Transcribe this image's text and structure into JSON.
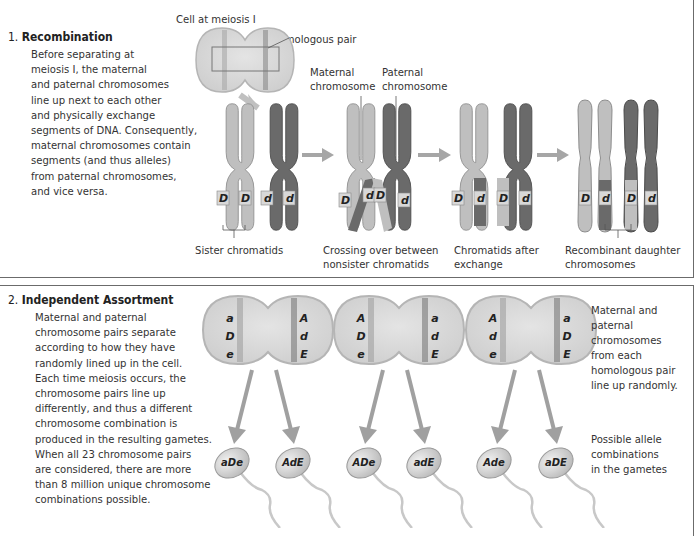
{
  "colors": {
    "maternal": "#bfbfbf",
    "paternal": "#6e6e6e",
    "arrow": "#a0a0a0",
    "cell_fill": "#d9d9d9",
    "border": "#6b6b6b"
  },
  "section1": {
    "number": "1.",
    "title": "Recombination",
    "body": [
      "Before separating at",
      "meiosis I, the maternal",
      "and paternal chromosomes",
      "line up next to each other",
      "and physically exchange",
      "segments of DNA. Consequently,",
      "maternal chromosomes contain",
      "segments (and thus alleles)",
      "from paternal chromosomes,",
      "and vice versa."
    ],
    "labels": {
      "cell": "Cell at meiosis I",
      "homologous_pair": "Homologous pair",
      "maternal_1": "Maternal",
      "maternal_2": "chromosome",
      "paternal_1": "Paternal",
      "paternal_2": "chromosome",
      "sister": "Sister chromatids",
      "crossing_1": "Crossing over between",
      "crossing_2": "nonsister chromatids",
      "after_1": "Chromatids after",
      "after_2": "exchange",
      "recomb_1": "Recombinant daughter",
      "recomb_2": "chromosomes"
    },
    "stages": [
      {
        "name": "before",
        "alleles": [
          "D",
          "D",
          "d",
          "d"
        ]
      },
      {
        "name": "crossing-over",
        "alleles": [
          "D",
          "d",
          "D",
          "d"
        ]
      },
      {
        "name": "after-exchange",
        "alleles": [
          "D",
          "d",
          "D",
          "d"
        ]
      },
      {
        "name": "recombinant",
        "alleles": [
          "D",
          "d",
          "D",
          "d"
        ]
      }
    ]
  },
  "section2": {
    "number": "2.",
    "title": "Independent Assortment",
    "body": [
      "Maternal and paternal",
      "chromosome pairs separate",
      "according to how they have",
      "randomly lined up in the cell.",
      "Each time meiosis occurs, the",
      "chromosome pairs line up",
      "differently, and thus a different",
      "chromosome combination is",
      "produced in the resulting gametes.",
      "When all 23 chromosome pairs",
      "are considered, there are more",
      "than 8 million unique chromosome",
      "combinations possible."
    ],
    "note_top": [
      "Maternal and",
      "paternal",
      "chromosomes",
      "from each",
      "homologous pair",
      "line up randomly."
    ],
    "note_bottom": [
      "Possible allele",
      "combinations",
      "in the gametes"
    ],
    "cells": [
      {
        "left": [
          "a",
          "D",
          "e"
        ],
        "right": [
          "A",
          "d",
          "E"
        ],
        "gametes": [
          "aDe",
          "AdE"
        ]
      },
      {
        "left": [
          "A",
          "D",
          "e"
        ],
        "right": [
          "a",
          "d",
          "E"
        ],
        "gametes": [
          "ADe",
          "adE"
        ]
      },
      {
        "left": [
          "A",
          "d",
          "e"
        ],
        "right": [
          "a",
          "D",
          "E"
        ],
        "gametes": [
          "Ade",
          "aDE"
        ]
      }
    ]
  }
}
